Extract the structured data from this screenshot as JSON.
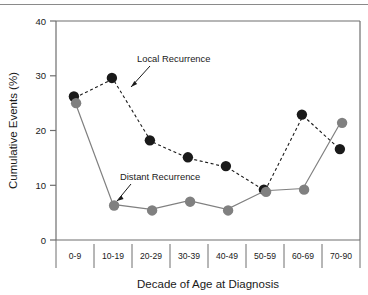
{
  "chart_data": {
    "type": "line",
    "title": "",
    "xlabel": "Decade of Age at Diagnosis",
    "ylabel": "Cumulative Events (%)",
    "categories": [
      "0-9",
      "10-19",
      "20-29",
      "30-39",
      "40-49",
      "50-59",
      "60-69",
      "70-90"
    ],
    "ylim": [
      0,
      40
    ],
    "yticks": [
      0,
      10,
      20,
      30,
      40
    ],
    "ytick_labels": [
      "0",
      "10",
      "20",
      "30",
      "40"
    ],
    "xlim_note": "categorical, 8 bins",
    "grid": false,
    "legend": "inline annotations with arrows",
    "series": [
      {
        "name": "Local Recurrence",
        "color": "#1a1a1a",
        "line_style": "dashed",
        "marker": "circle",
        "values": [
          26.0,
          29.4,
          18.0,
          14.9,
          13.3,
          9.0,
          22.7,
          16.4
        ]
      },
      {
        "name": "Distant Recurrence",
        "color": "#808080",
        "line_style": "solid",
        "marker": "circle",
        "values": [
          25.2,
          6.5,
          5.6,
          7.2,
          5.6,
          9.0,
          9.4,
          21.6
        ]
      }
    ],
    "annotations": [
      {
        "text": "Local Recurrence",
        "points_to_series": "Local Recurrence"
      },
      {
        "text": "Distant Recurrence",
        "points_to_series": "Distant Recurrence"
      }
    ]
  }
}
